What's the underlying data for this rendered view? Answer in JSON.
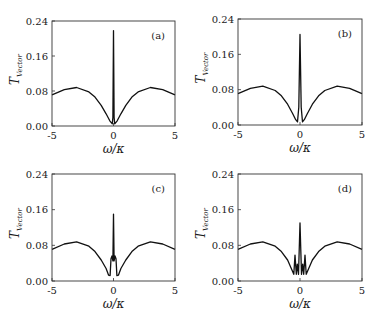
{
  "figure": {
    "x_label_main": "ω",
    "x_label_sep": "/",
    "x_label_sub": "κ",
    "y_label_main": "T",
    "y_label_sub": "Vector"
  },
  "chart_data": [
    {
      "type": "line",
      "panel_label": "(a)",
      "title": "",
      "xlabel": "ω/κ",
      "ylabel": "T_Vector",
      "xlim": [
        -5,
        5
      ],
      "ylim": [
        0,
        0.24
      ],
      "xticks": [
        "-5",
        "0",
        "5"
      ],
      "yticks": [
        "0.00",
        "0.08",
        "0.16",
        "0.24"
      ],
      "grid": false,
      "x": [
        -5,
        -4,
        -3,
        -2,
        -1.5,
        -1,
        -0.6,
        -0.3,
        -0.1,
        -0.05,
        0,
        0.05,
        0.1,
        0.3,
        0.6,
        1,
        1.5,
        2,
        3,
        4,
        5
      ],
      "values": [
        0.071,
        0.083,
        0.088,
        0.078,
        0.066,
        0.047,
        0.028,
        0.012,
        0.005,
        0.02,
        0.218,
        0.02,
        0.005,
        0.012,
        0.028,
        0.047,
        0.066,
        0.078,
        0.088,
        0.083,
        0.071
      ]
    },
    {
      "type": "line",
      "panel_label": "(b)",
      "title": "",
      "xlabel": "ω/κ",
      "ylabel": "T_Vector",
      "xlim": [
        -5,
        5
      ],
      "ylim": [
        0,
        0.24
      ],
      "xticks": [
        "-5",
        "0",
        "5"
      ],
      "yticks": [
        "0.00",
        "0.08",
        "0.16",
        "0.24"
      ],
      "grid": false,
      "x": [
        -5,
        -4,
        -3,
        -2,
        -1.5,
        -1,
        -0.6,
        -0.35,
        -0.2,
        -0.1,
        0,
        0.1,
        0.2,
        0.35,
        0.6,
        1,
        1.5,
        2,
        3,
        4,
        5
      ],
      "values": [
        0.071,
        0.083,
        0.088,
        0.078,
        0.066,
        0.047,
        0.026,
        0.012,
        0.007,
        0.04,
        0.205,
        0.04,
        0.007,
        0.012,
        0.026,
        0.047,
        0.066,
        0.078,
        0.088,
        0.083,
        0.071
      ]
    },
    {
      "type": "line",
      "panel_label": "(c)",
      "title": "",
      "xlabel": "ω/κ",
      "ylabel": "T_Vector",
      "xlim": [
        -5,
        5
      ],
      "ylim": [
        0,
        0.24
      ],
      "xticks": [
        "-5",
        "0",
        "5"
      ],
      "yticks": [
        "0.00",
        "0.08",
        "0.16",
        "0.24"
      ],
      "grid": false,
      "x": [
        -5,
        -4,
        -3,
        -2,
        -1.5,
        -1,
        -0.6,
        -0.4,
        -0.28,
        -0.2,
        -0.12,
        -0.05,
        0,
        0.05,
        0.12,
        0.2,
        0.28,
        0.4,
        0.6,
        1,
        1.5,
        2,
        3,
        4,
        5
      ],
      "values": [
        0.071,
        0.083,
        0.088,
        0.078,
        0.066,
        0.047,
        0.028,
        0.013,
        0.012,
        0.05,
        0.056,
        0.045,
        0.15,
        0.045,
        0.056,
        0.05,
        0.012,
        0.013,
        0.028,
        0.047,
        0.066,
        0.078,
        0.088,
        0.083,
        0.071
      ]
    },
    {
      "type": "line",
      "panel_label": "(d)",
      "title": "",
      "xlabel": "ω/κ",
      "ylabel": "T_Vector",
      "xlim": [
        -5,
        5
      ],
      "ylim": [
        0,
        0.24
      ],
      "xticks": [
        "-5",
        "0",
        "5"
      ],
      "yticks": [
        "0.00",
        "0.08",
        "0.16",
        "0.24"
      ],
      "grid": false,
      "x": [
        -5,
        -4,
        -3,
        -2,
        -1.5,
        -1,
        -0.7,
        -0.5,
        -0.4,
        -0.3,
        -0.22,
        -0.12,
        0,
        0.12,
        0.22,
        0.3,
        0.4,
        0.5,
        0.7,
        1,
        1.5,
        2,
        3,
        4,
        5
      ],
      "values": [
        0.071,
        0.083,
        0.088,
        0.078,
        0.066,
        0.047,
        0.028,
        0.015,
        0.058,
        0.015,
        0.038,
        0.015,
        0.13,
        0.015,
        0.038,
        0.015,
        0.058,
        0.015,
        0.028,
        0.047,
        0.066,
        0.078,
        0.088,
        0.083,
        0.071
      ]
    }
  ]
}
